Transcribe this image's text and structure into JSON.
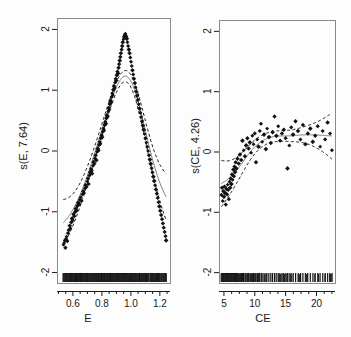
{
  "figure": {
    "background_color": "#fdfdfd",
    "foreground_color": "#1a1a1a",
    "width": 351,
    "height": 337
  },
  "chart_data": [
    {
      "type": "scatter",
      "panel": "left",
      "title": "",
      "xlabel": "E",
      "ylabel": "s(E, 7.64)",
      "xlim": [
        0.49,
        1.27
      ],
      "ylim": [
        -2.18,
        2.18
      ],
      "xticks": [
        0.6,
        0.8,
        1.0,
        1.2
      ],
      "xtick_labels": [
        "0.6",
        "0.8",
        "1.0",
        "1.2"
      ],
      "yticks": [
        -2,
        -1,
        0,
        1,
        2
      ],
      "ytick_labels": [
        "-2",
        "-1",
        "0",
        "1",
        "2"
      ],
      "grid": false,
      "legend": "none",
      "series": [
        {
          "name": "partial residuals",
          "style": "points",
          "x": [
            0.534,
            0.539,
            0.545,
            0.548,
            0.552,
            0.556,
            0.561,
            0.566,
            0.571,
            0.578,
            0.583,
            0.589,
            0.594,
            0.599,
            0.604,
            0.609,
            0.615,
            0.62,
            0.625,
            0.631,
            0.637,
            0.643,
            0.648,
            0.654,
            0.66,
            0.665,
            0.671,
            0.677,
            0.682,
            0.688,
            0.694,
            0.699,
            0.704,
            0.709,
            0.714,
            0.719,
            0.724,
            0.729,
            0.733,
            0.738,
            0.743,
            0.748,
            0.753,
            0.757,
            0.762,
            0.766,
            0.771,
            0.776,
            0.78,
            0.785,
            0.789,
            0.793,
            0.798,
            0.802,
            0.806,
            0.81,
            0.815,
            0.819,
            0.823,
            0.827,
            0.831,
            0.835,
            0.839,
            0.843,
            0.847,
            0.851,
            0.855,
            0.859,
            0.863,
            0.867,
            0.871,
            0.875,
            0.879,
            0.883,
            0.887,
            0.891,
            0.895,
            0.899,
            0.903,
            0.907,
            0.911,
            0.915,
            0.919,
            0.923,
            0.927,
            0.931,
            0.936,
            0.94,
            0.944,
            0.949,
            0.953,
            0.958,
            0.962,
            0.967,
            0.972,
            0.976,
            0.981,
            0.986,
            0.991,
            0.996,
            1.001,
            1.006,
            1.011,
            1.016,
            1.021,
            1.027,
            1.032,
            1.037,
            1.043,
            1.048,
            1.054,
            1.059,
            1.065,
            1.071,
            1.077,
            1.083,
            1.089,
            1.095,
            1.101,
            1.107,
            1.113,
            1.119,
            1.125,
            1.131,
            1.137,
            1.143,
            1.149,
            1.155,
            1.161,
            1.167,
            1.173,
            1.179,
            1.185,
            1.191,
            1.197,
            1.203,
            1.209,
            1.215,
            1.221,
            1.227,
            1.233,
            1.239,
            1.243
          ],
          "y": [
            -1.55,
            -1.52,
            -1.48,
            -1.6,
            -1.46,
            -1.42,
            -1.49,
            -1.36,
            -1.31,
            -1.24,
            -1.28,
            -1.18,
            -1.12,
            -1.15,
            -1.05,
            -1.08,
            -1.01,
            -0.96,
            -0.99,
            -0.91,
            -0.86,
            -0.88,
            -0.81,
            -0.77,
            -0.83,
            -0.72,
            -0.67,
            -0.7,
            -0.62,
            -0.57,
            -0.6,
            -0.51,
            -0.46,
            -0.55,
            -0.41,
            -0.36,
            -0.3,
            -0.33,
            -0.38,
            -0.25,
            -0.19,
            -0.22,
            -0.13,
            -0.08,
            -0.16,
            -0.02,
            0.03,
            0.0,
            0.09,
            0.14,
            0.11,
            0.2,
            0.25,
            0.22,
            0.31,
            0.36,
            0.33,
            0.42,
            0.47,
            0.44,
            0.53,
            0.58,
            0.56,
            0.64,
            0.7,
            0.67,
            0.76,
            0.82,
            0.79,
            0.88,
            0.94,
            0.91,
            1.0,
            1.06,
            1.03,
            1.12,
            1.18,
            1.15,
            1.24,
            1.3,
            1.27,
            1.36,
            1.42,
            1.48,
            1.54,
            1.6,
            1.66,
            1.72,
            1.78,
            1.83,
            1.87,
            1.9,
            1.92,
            1.88,
            1.84,
            1.78,
            1.72,
            1.66,
            1.6,
            1.53,
            1.46,
            1.39,
            1.32,
            1.25,
            1.18,
            1.11,
            1.04,
            0.97,
            0.9,
            0.83,
            0.76,
            0.69,
            0.62,
            0.55,
            0.48,
            0.41,
            0.34,
            0.27,
            0.2,
            0.13,
            0.06,
            -0.01,
            -0.08,
            -0.15,
            -0.22,
            -0.29,
            -0.36,
            -0.43,
            -0.5,
            -0.57,
            -0.64,
            -0.71,
            -0.78,
            -0.85,
            -0.92,
            -0.99,
            -1.06,
            -1.13,
            -1.2,
            -1.27,
            -1.34,
            -1.41,
            -1.48
          ]
        },
        {
          "name": "smooth fit",
          "style": "line-solid"
        },
        {
          "name": "confidence band",
          "style": "line-dashed"
        },
        {
          "name": "rug",
          "style": "rug-ticks"
        }
      ]
    },
    {
      "type": "scatter",
      "panel": "right",
      "title": "",
      "xlabel": "CE",
      "ylabel": "s(CE, 4.26)",
      "xlim": [
        4.2,
        23.0
      ],
      "ylim": [
        -2.18,
        2.18
      ],
      "xticks": [
        5,
        10,
        15,
        20
      ],
      "xtick_labels": [
        "5",
        "10",
        "15",
        "20"
      ],
      "yticks": [
        -2,
        -1,
        0,
        1,
        2
      ],
      "ytick_labels": [
        "-2",
        "-1",
        "0",
        "1",
        "2"
      ],
      "grid": false,
      "legend": "none",
      "series": [
        {
          "name": "partial residuals",
          "style": "points",
          "x": [
            4.6,
            4.7,
            4.8,
            4.9,
            5.0,
            5.1,
            5.2,
            5.3,
            5.4,
            5.5,
            5.6,
            5.7,
            5.8,
            5.9,
            6.0,
            6.1,
            6.2,
            6.3,
            6.4,
            6.5,
            6.6,
            6.7,
            6.8,
            6.9,
            7.0,
            7.2,
            7.4,
            7.6,
            7.8,
            8.0,
            8.2,
            8.4,
            8.6,
            8.8,
            9.0,
            9.2,
            9.4,
            9.6,
            9.8,
            10.0,
            10.2,
            10.4,
            10.6,
            10.8,
            11.0,
            11.2,
            11.5,
            11.8,
            12.0,
            12.3,
            12.6,
            12.9,
            13.2,
            13.5,
            13.8,
            14.1,
            14.4,
            14.7,
            15.0,
            15.3,
            15.6,
            15.9,
            16.2,
            16.6,
            17.0,
            17.4,
            17.8,
            18.2,
            18.6,
            19.0,
            19.4,
            19.8,
            20.2,
            20.6,
            21.0,
            21.4,
            21.8,
            22.2,
            22.5
          ],
          "y": [
            -0.72,
            -0.6,
            -0.82,
            -0.66,
            -0.75,
            -0.58,
            -0.69,
            -0.88,
            -0.62,
            -0.71,
            -0.55,
            -0.64,
            -0.79,
            -0.5,
            -0.6,
            -0.45,
            -0.54,
            -0.38,
            -0.47,
            -0.3,
            -0.41,
            -0.25,
            -0.34,
            -0.18,
            -0.28,
            -0.12,
            -0.2,
            -0.05,
            -0.14,
            0.18,
            0.02,
            -0.08,
            0.1,
            0.22,
            0.05,
            0.15,
            -0.02,
            0.26,
            0.12,
            0.3,
            -0.18,
            0.2,
            0.08,
            0.34,
            0.46,
            0.16,
            0.28,
            0.04,
            0.38,
            0.24,
            0.14,
            0.32,
            0.58,
            0.26,
            0.42,
            0.18,
            0.3,
            0.36,
            0.22,
            -0.28,
            0.1,
            0.4,
            0.28,
            0.5,
            0.34,
            0.2,
            0.44,
            0.12,
            0.3,
            0.38,
            0.16,
            0.26,
            0.42,
            0.08,
            0.34,
            0.2,
            0.48,
            0.3,
            0.02
          ]
        },
        {
          "name": "smooth fit",
          "style": "line-solid"
        },
        {
          "name": "confidence band",
          "style": "line-dashed"
        },
        {
          "name": "rug",
          "style": "rug-ticks"
        }
      ]
    }
  ]
}
